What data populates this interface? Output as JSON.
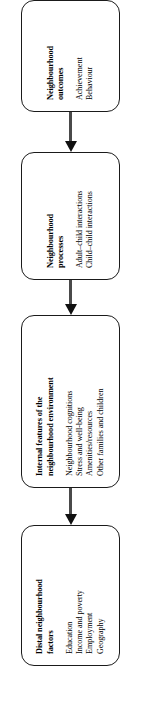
{
  "figure": {
    "type": "flowchart",
    "orientation": "vertical-rotated",
    "arrow_direction": "upward",
    "colors": {
      "box_border": "#1a1a1a",
      "arrow": "#111111",
      "shaft": "#4a4a4a",
      "text": "#000000",
      "background": "#ffffff"
    },
    "nodes": [
      {
        "id": "neighbourhood-outcomes",
        "title": "Neighbourhood outcomes",
        "title_lines": [
          "Neighbourhood",
          "outcomes"
        ],
        "items": [
          "Achievement",
          "Behaviour"
        ]
      },
      {
        "id": "neighbourhood-processes",
        "title": "Neighbourhood processes",
        "title_lines": [
          "Neighbourhood",
          "processes"
        ],
        "items": [
          "Adult–child interactions",
          "Child–child interactions"
        ]
      },
      {
        "id": "internal-features",
        "title": "Internal features of the neighbourhood environment",
        "title_lines": [
          "Internal features of the",
          "neighbourhood environment"
        ],
        "items": [
          "Neighbourhood cognitions",
          "Stress and well-being",
          "Amenities/resources",
          "Other families and children"
        ]
      },
      {
        "id": "distal-factors",
        "title": "Distal neighbourhood factors",
        "title_lines": [
          "Distal neighbourhood",
          "factors"
        ],
        "items": [
          "Education",
          "Income and poverty",
          "Employment",
          "Geography"
        ]
      }
    ],
    "connectors": [
      {
        "id": "arrow-distal-to-internal",
        "glyph": "▲"
      },
      {
        "id": "arrow-internal-to-processes",
        "glyph": "▲"
      },
      {
        "id": "arrow-processes-to-outcomes",
        "glyph": "▲"
      }
    ]
  }
}
